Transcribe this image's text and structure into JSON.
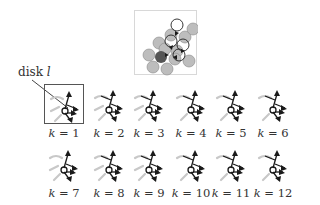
{
  "overview": {
    "name": "disk-configuration-overview",
    "gray_disks": [
      {
        "cx": 14,
        "cy": 44
      },
      {
        "cx": 24,
        "cy": 32
      },
      {
        "cx": 18,
        "cy": 56
      },
      {
        "cx": 32,
        "cy": 58
      },
      {
        "cx": 42,
        "cy": 40
      },
      {
        "cx": 50,
        "cy": 26
      },
      {
        "cx": 54,
        "cy": 50
      },
      {
        "cx": 36,
        "cy": 24
      },
      {
        "cx": 40,
        "cy": 48
      },
      {
        "cx": 30,
        "cy": 38
      },
      {
        "cx": 58,
        "cy": 18
      }
    ],
    "dark_disk": {
      "cx": 26,
      "cy": 46
    },
    "outline_disks": [
      {
        "cx": 42,
        "cy": 14
      },
      {
        "cx": 48,
        "cy": 34
      },
      {
        "cx": 36,
        "cy": 30
      },
      {
        "cx": 44,
        "cy": 44
      }
    ],
    "colors": {
      "gray": "#bdbdbd",
      "dark": "#555555",
      "outline": "#222222",
      "border": "#d8d8d8"
    }
  },
  "callout": {
    "label": "disk",
    "variable": "l"
  },
  "panels": [
    {
      "k": "1",
      "label_prefix": "k",
      "label_eq": " = ",
      "highlighted": true
    },
    {
      "k": "2",
      "label_prefix": "k",
      "label_eq": " = ",
      "highlighted": false
    },
    {
      "k": "3",
      "label_prefix": "k",
      "label_eq": " = ",
      "highlighted": false
    },
    {
      "k": "4",
      "label_prefix": "k",
      "label_eq": " = ",
      "highlighted": false
    },
    {
      "k": "5",
      "label_prefix": "k",
      "label_eq": " = ",
      "highlighted": false
    },
    {
      "k": "6",
      "label_prefix": "k",
      "label_eq": " = ",
      "highlighted": false
    },
    {
      "k": "7",
      "label_prefix": "k",
      "label_eq": " = ",
      "highlighted": false
    },
    {
      "k": "8",
      "label_prefix": "k",
      "label_eq": " = ",
      "highlighted": false
    },
    {
      "k": "9",
      "label_prefix": "k",
      "label_eq": " = ",
      "highlighted": false
    },
    {
      "k": "10",
      "label_prefix": "k",
      "label_eq": " = ",
      "highlighted": false
    },
    {
      "k": "11",
      "label_prefix": "k",
      "label_eq": " = ",
      "highlighted": false
    },
    {
      "k": "12",
      "label_prefix": "k",
      "label_eq": " = ",
      "highlighted": false
    }
  ],
  "colors": {
    "arrow_dark": "#1a1a1a",
    "arrow_light": "#c8c8c8",
    "text": "#333333"
  }
}
